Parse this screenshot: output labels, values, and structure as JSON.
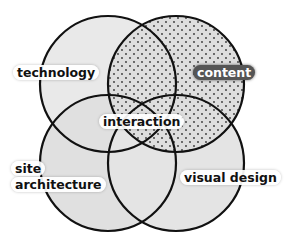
{
  "diagram": {
    "type": "venn",
    "sets": [
      {
        "id": "technology",
        "label": "technology",
        "position": "top-left",
        "fill": "#e2e2e2",
        "pattern": "none"
      },
      {
        "id": "content",
        "label": "content",
        "position": "top-right",
        "fill": "#d6d6d6",
        "pattern": "dots"
      },
      {
        "id": "site-architecture",
        "label_line1": "site",
        "label_line2": "architecture",
        "position": "bottom-left",
        "fill": "#dcdcdc",
        "pattern": "none"
      },
      {
        "id": "visual-design",
        "label": "visual design",
        "position": "bottom-right",
        "fill": "#dedede",
        "pattern": "none"
      }
    ],
    "center_label": "interaction",
    "colors": {
      "outline": "#111111",
      "dot": "#333333",
      "label_dark_bg": "#555555"
    }
  }
}
